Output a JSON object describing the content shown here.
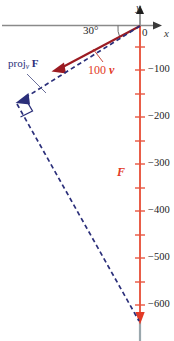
{
  "figure": {
    "axes": {
      "x_label": "x",
      "y_label": "y",
      "origin_label": "0",
      "axis_color": "#8a8a8a",
      "y_axis_color": "#e8553f"
    },
    "angle": {
      "label": "30°"
    },
    "y_ticks": [
      {
        "label": "−100",
        "value": -100
      },
      {
        "label": "−200",
        "value": -200
      },
      {
        "label": "−300",
        "value": -300
      },
      {
        "label": "−400",
        "value": -400
      },
      {
        "label": "−500",
        "value": -500
      },
      {
        "label": "−600",
        "value": -600
      }
    ],
    "vectors": [
      {
        "name": "100v",
        "number": "100",
        "symbol": "v",
        "color": "#9b1b22",
        "label_color": "#e23a26"
      },
      {
        "name": "F",
        "symbol": "F",
        "color": "#e8553f",
        "label_color": "#e23a26"
      },
      {
        "name": "projection",
        "label_main": "proj",
        "label_sub": "v",
        "label_bold": "F",
        "color": "#2b2f7a"
      }
    ],
    "colors": {
      "red_arrow": "#9b1b22",
      "red_axis": "#e8553f",
      "blue_dashed": "#2b2f7a",
      "gray_axis": "#8a8a8a"
    }
  }
}
